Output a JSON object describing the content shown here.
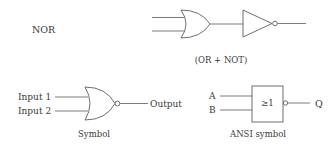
{
  "title_label": "NOR",
  "top_caption": "(OR + NOT)",
  "symbol": {
    "input1": "Input 1",
    "input2": "Input 2",
    "output": "Output",
    "caption": "Symbol"
  },
  "ansi": {
    "input_a": "A",
    "input_b": "B",
    "gate_text": "≥1",
    "output": "Q",
    "caption": "ANSI symbol"
  }
}
